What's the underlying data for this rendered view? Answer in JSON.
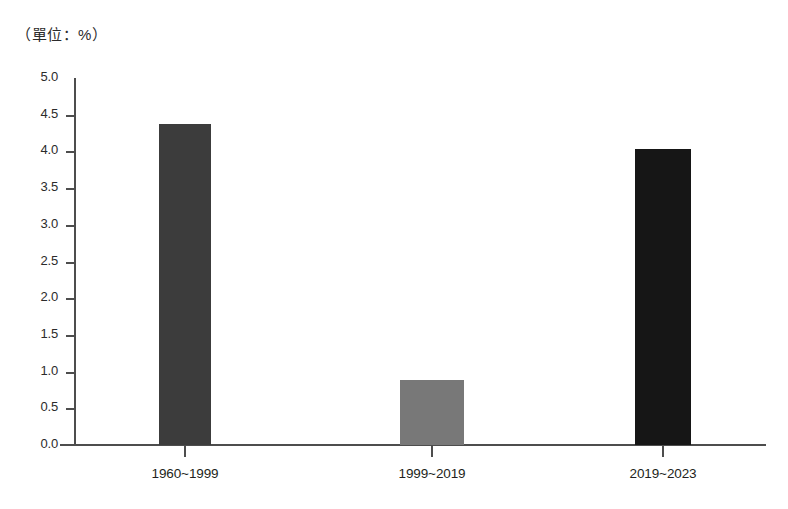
{
  "caption": "（單位：%）",
  "chart_data": {
    "type": "bar",
    "title": "",
    "subtitle": "",
    "xlabel": "",
    "ylabel": "",
    "unit_note": "（單位：%）",
    "categories": [
      "1960~1999",
      "1999~2019",
      "2019~2023"
    ],
    "values": [
      4.37,
      0.88,
      4.03
    ],
    "series": [
      {
        "name": "",
        "values": [
          4.37,
          0.88,
          4.03
        ]
      }
    ],
    "bar_colors": [
      "#3c3c3c",
      "#787878",
      "#161616"
    ],
    "ylim": [
      0.0,
      5.0
    ],
    "ytick_labels": [
      "5.0",
      "4.5",
      "4.0",
      "3.5",
      "3.0",
      "2.5",
      "2.0",
      "1.5",
      "1.0",
      "0.5",
      "0.0"
    ],
    "ytick_values": [
      5.0,
      4.5,
      4.0,
      3.5,
      3.0,
      2.5,
      2.0,
      1.5,
      1.0,
      0.5,
      0.0
    ],
    "ytick_step": 0.5,
    "grid": false,
    "legend": false,
    "legend_position": "none",
    "axis_color": "#4d4d4d",
    "background": "#ffffff"
  }
}
